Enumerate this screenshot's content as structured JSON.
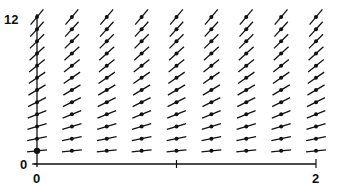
{
  "diagram": {
    "type": "slope-field",
    "x_axis": {
      "min": 0,
      "max": 2,
      "tick_labels": [
        "0",
        "2"
      ],
      "ticks": [
        0,
        1,
        2
      ]
    },
    "y_axis": {
      "min": 0,
      "max": 12,
      "tick_labels": [
        "0",
        "12"
      ]
    },
    "grid": {
      "x_values": [
        0,
        0.25,
        0.5,
        0.75,
        1.0,
        1.25,
        1.5,
        1.75,
        2.0
      ],
      "y_values": [
        1,
        2,
        3,
        4,
        5,
        6,
        7,
        8,
        9,
        10,
        11,
        12
      ]
    },
    "slope_visual_factor": 0.1,
    "segment_half_length_px": 10,
    "colors": {
      "ink": "#111111",
      "background": "#ffffff"
    }
  },
  "labels": {
    "y_top": "12",
    "y_bottom": "0",
    "x_left": "0",
    "x_right": "2"
  }
}
